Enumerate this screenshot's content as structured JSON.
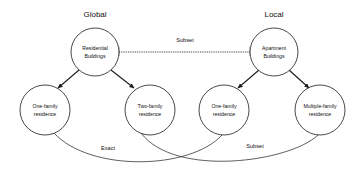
{
  "diagram": {
    "background_color": "#ffffff",
    "stroke_color": "#1a1a1a",
    "text_color": "#111111",
    "group_labels": {
      "left": "Global",
      "right": "Local"
    },
    "nodes": [
      {
        "id": "residential-buildings",
        "line1": "Residential",
        "line2": "Buildings",
        "cx": 95,
        "cy": 52,
        "r": 24
      },
      {
        "id": "apartment-buildings",
        "line1": "Apartment",
        "line2": "Buildings",
        "cx": 274,
        "cy": 52,
        "r": 24
      },
      {
        "id": "one-family-residence-global",
        "line1": "One-family",
        "line2": "residence",
        "cx": 45,
        "cy": 110,
        "r": 25
      },
      {
        "id": "two-family-residence-global",
        "line1": "Two-family",
        "line2": "residence",
        "cx": 150,
        "cy": 110,
        "r": 25
      },
      {
        "id": "one-family-residence-local",
        "line1": "One-family",
        "line2": "residence",
        "cx": 224,
        "cy": 110,
        "r": 25
      },
      {
        "id": "multiple-family-residence-local",
        "line1": "Multiple-family",
        "line2": "residence",
        "cx": 320,
        "cy": 110,
        "r": 25
      }
    ],
    "edges": [
      {
        "id": "subset-top",
        "label": "Subset",
        "style": "dotted",
        "from": "residential-buildings",
        "to": "apartment-buildings",
        "label_x": 185,
        "label_y": 42
      },
      {
        "id": "residential-to-one-family",
        "label": "",
        "style": "arrow",
        "from": "residential-buildings",
        "to": "one-family-residence-global"
      },
      {
        "id": "residential-to-two-family",
        "label": "",
        "style": "arrow",
        "from": "residential-buildings",
        "to": "two-family-residence-global"
      },
      {
        "id": "apartment-to-one-family",
        "label": "",
        "style": "arrow",
        "from": "apartment-buildings",
        "to": "one-family-residence-local"
      },
      {
        "id": "apartment-to-multiple-family",
        "label": "",
        "style": "arrow",
        "from": "apartment-buildings",
        "to": "multiple-family-residence-local"
      },
      {
        "id": "exact-curve",
        "label": "Exact",
        "style": "curve",
        "from": "one-family-residence-global",
        "to": "one-family-residence-local",
        "label_x": 108,
        "label_y": 150
      },
      {
        "id": "subset-curve",
        "label": "Subset",
        "style": "curve",
        "from": "two-family-residence-global",
        "to": "multiple-family-residence-local",
        "label_x": 255,
        "label_y": 148
      }
    ]
  }
}
